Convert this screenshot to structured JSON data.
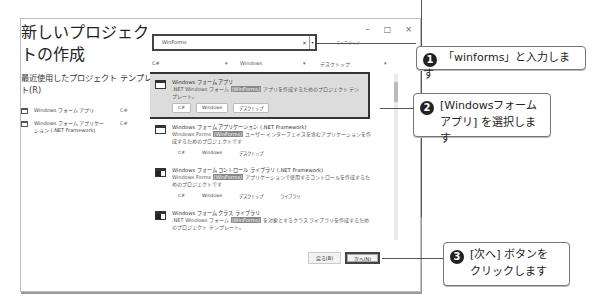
{
  "dialog": {
    "window_controls": {
      "minimize": "–",
      "maximize": "□",
      "close": "×"
    },
    "title": "新しいプロジェクトの作成",
    "recent": {
      "heading": "最近使用したプロジェクト テンプレート(R)",
      "items": [
        {
          "name": "Windows フォーム アプリ",
          "lang": "C#"
        },
        {
          "name": "Windows フォーム アプリケーション (.NET Framework)",
          "lang": "C#"
        }
      ]
    },
    "search": {
      "value": "WinForms",
      "clear": "×",
      "dropdown": "▾",
      "clear_all": "すべてクリア"
    },
    "filters": {
      "language": "C#",
      "platform": "Windows",
      "project_type": "デスクトップ",
      "dropdown": "▾"
    },
    "templates": [
      {
        "title": "Windows フォーム アプリ",
        "desc_before": ".NET Windows フォーム ",
        "highlight": "(WinForms)",
        "desc_after": " アプリを作成するためのプロジェクト テンプレート。",
        "tags": [
          "C#",
          "Windows",
          "デスクトップ"
        ],
        "selected": true
      },
      {
        "title": "Windows フォーム アプリケーション (.NET Framework)",
        "desc_before": "Windows Forms ",
        "highlight": "(WinForms)",
        "desc_after": " ユーザー インターフェイスを含むアプリケーションを作成するためのプロジェクトです",
        "tags": [
          "C#",
          "Windows",
          "デスクトップ"
        ],
        "selected": false
      },
      {
        "title": "Windows フォーム コントロール ライブラリ (.NET Framework)",
        "desc_before": "Windows Forms ",
        "highlight": "(WinForms)",
        "desc_after": " アプリケーションで使用するコントロールを作成するためのプロジェクトです",
        "tags": [
          "C#",
          "Windows",
          "デスクトップ",
          "ライブラリ"
        ],
        "selected": false
      },
      {
        "title": "Windows フォーム クラス ライブラリ",
        "desc_before": ".NET Windows フォーム ",
        "highlight": "(WinForms)",
        "desc_after": " を対象とするクラス ライブラリを作成するためのプロジェクト テンプレート。",
        "tags": [],
        "selected": false
      }
    ],
    "buttons": {
      "back": "戻る(B)",
      "next": "次へ(N)"
    }
  },
  "callouts": [
    {
      "num": "1",
      "line1": "「winforms」と入力します",
      "line2": ""
    },
    {
      "num": "2",
      "line1": "[Windowsフォーム",
      "line2": "アプリ] を選択します"
    },
    {
      "num": "3",
      "line1": "[次へ] ボタンを",
      "line2": "クリックします"
    }
  ]
}
